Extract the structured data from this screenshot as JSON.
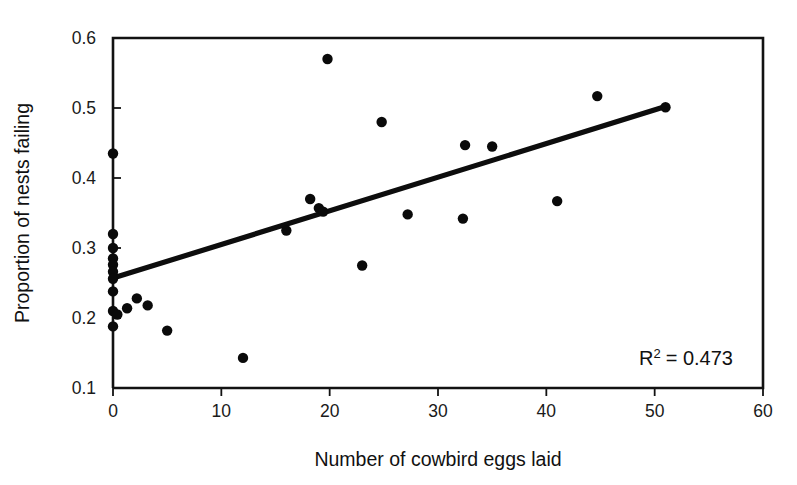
{
  "chart_data": {
    "type": "scatter",
    "title": "",
    "xlabel": "Number of cowbird eggs laid",
    "ylabel": "Proportion of nests failing",
    "xlim": [
      0,
      60
    ],
    "ylim": [
      0.1,
      0.6
    ],
    "xticks": [
      "0",
      "10",
      "20",
      "30",
      "40",
      "50",
      "60"
    ],
    "xtick_values": [
      0,
      10,
      20,
      30,
      40,
      50,
      60
    ],
    "yticks": [
      "0.1",
      "0.2",
      "0.3",
      "0.4",
      "0.5",
      "0.6"
    ],
    "ytick_values": [
      0.1,
      0.2,
      0.3,
      0.4,
      0.5,
      0.6
    ],
    "grid": false,
    "legend": null,
    "points": [
      {
        "x": 0,
        "y": 0.435
      },
      {
        "x": 0,
        "y": 0.32
      },
      {
        "x": 0,
        "y": 0.3
      },
      {
        "x": 0,
        "y": 0.285
      },
      {
        "x": 0,
        "y": 0.276
      },
      {
        "x": 0,
        "y": 0.266
      },
      {
        "x": 0,
        "y": 0.256
      },
      {
        "x": 0,
        "y": 0.238
      },
      {
        "x": 0,
        "y": 0.21
      },
      {
        "x": 0.4,
        "y": 0.205
      },
      {
        "x": 0,
        "y": 0.188
      },
      {
        "x": 1.3,
        "y": 0.214
      },
      {
        "x": 2.2,
        "y": 0.228
      },
      {
        "x": 3.2,
        "y": 0.218
      },
      {
        "x": 5.0,
        "y": 0.182
      },
      {
        "x": 12.0,
        "y": 0.143
      },
      {
        "x": 16.0,
        "y": 0.325
      },
      {
        "x": 18.2,
        "y": 0.37
      },
      {
        "x": 19.0,
        "y": 0.357
      },
      {
        "x": 19.4,
        "y": 0.352
      },
      {
        "x": 19.8,
        "y": 0.57
      },
      {
        "x": 23.0,
        "y": 0.275
      },
      {
        "x": 24.8,
        "y": 0.48
      },
      {
        "x": 27.2,
        "y": 0.348
      },
      {
        "x": 32.3,
        "y": 0.342
      },
      {
        "x": 32.5,
        "y": 0.447
      },
      {
        "x": 35.0,
        "y": 0.445
      },
      {
        "x": 41.0,
        "y": 0.367
      },
      {
        "x": 44.7,
        "y": 0.517
      },
      {
        "x": 51.0,
        "y": 0.501
      }
    ],
    "trendline": {
      "x_start": 0,
      "y_start": 0.257,
      "x_end": 51,
      "y_end": 0.502
    },
    "annotations": [
      {
        "name": "r-squared",
        "text": "R2 = 0.473",
        "r_symbol": "R",
        "superscript": "2",
        "equals_value": "= 0.473",
        "value": 0.473
      }
    ]
  },
  "colors": {
    "point": "#0a0a0a",
    "line": "#0d0d0d",
    "axis": "#121212",
    "background": "#ffffff",
    "text": "#111111"
  }
}
